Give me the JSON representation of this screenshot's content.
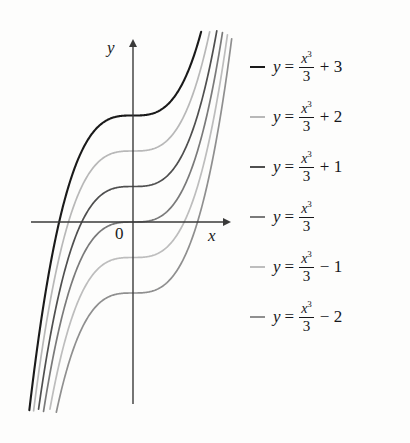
{
  "figure": {
    "axes": {
      "y_label": "y",
      "x_label": "x",
      "origin_label": "0"
    },
    "colors": {
      "background": "#fdfdfc",
      "axis": "#3a3a3a",
      "curve_dark": "#1a1a1a",
      "curve_mid_dark": "#4a4a4a",
      "curve_mid": "#6e6e6e",
      "curve_light": "#9a9a9a",
      "curve_lighter": "#b0b0b0"
    }
  },
  "legend": {
    "entries": [
      {
        "dash_color": "#1a1a1a",
        "lhs": "y",
        "eq": "=",
        "numerator": "x",
        "power": "3",
        "denominator": "3",
        "term": "+ 3",
        "c": 3
      },
      {
        "dash_color": "#b8b8b8",
        "lhs": "y",
        "eq": "=",
        "numerator": "x",
        "power": "3",
        "denominator": "3",
        "term": "+ 2",
        "c": 2
      },
      {
        "dash_color": "#4f4f4f",
        "lhs": "y",
        "eq": "=",
        "numerator": "x",
        "power": "3",
        "denominator": "3",
        "term": "+ 1",
        "c": 1
      },
      {
        "dash_color": "#7a7a7a",
        "lhs": "y",
        "eq": "=",
        "numerator": "x",
        "power": "3",
        "denominator": "3",
        "term": "",
        "c": 0
      },
      {
        "dash_color": "#bdbdbd",
        "lhs": "y",
        "eq": "=",
        "numerator": "x",
        "power": "3",
        "denominator": "3",
        "term": "− 1",
        "c": -1
      },
      {
        "dash_color": "#8f8f8f",
        "lhs": "y",
        "eq": "=",
        "numerator": "x",
        "power": "3",
        "denominator": "3",
        "term": "− 2",
        "c": -2
      }
    ]
  },
  "chart_data": {
    "type": "line",
    "title": "",
    "xlabel": "x",
    "ylabel": "y",
    "function_family": "y = x^3/3 + C",
    "xlim": [
      -3.0,
      2.6
    ],
    "ylim": [
      -5.2,
      4.6
    ],
    "grid": false,
    "legend_position": "right",
    "x": [
      -3.0,
      -2.75,
      -2.5,
      -2.25,
      -2.0,
      -1.75,
      -1.5,
      -1.25,
      -1.0,
      -0.75,
      -0.5,
      -0.25,
      0.0,
      0.25,
      0.5,
      0.75,
      1.0,
      1.25,
      1.5,
      1.75,
      2.0,
      2.25,
      2.5
    ],
    "series": [
      {
        "name": "y = x^3/3 + 3",
        "C": 3,
        "color": "#1a1a1a",
        "y_intercept": 3,
        "values": [
          -6.0,
          -3.93,
          -2.21,
          -0.797,
          0.333,
          1.214,
          1.875,
          2.349,
          2.667,
          2.859,
          2.958,
          2.995,
          3.0,
          3.005,
          3.042,
          3.141,
          3.333,
          3.651,
          4.125,
          4.786,
          5.667,
          6.797,
          8.208
        ]
      },
      {
        "name": "y = x^3/3 + 2",
        "C": 2,
        "color": "#b8b8b8",
        "y_intercept": 2,
        "values": [
          -7.0,
          -4.93,
          -3.21,
          -1.797,
          -0.667,
          0.214,
          0.875,
          1.349,
          1.667,
          1.859,
          1.958,
          1.995,
          2.0,
          2.005,
          2.042,
          2.141,
          2.333,
          2.651,
          3.125,
          3.786,
          4.667,
          5.797,
          7.208
        ]
      },
      {
        "name": "y = x^3/3 + 1",
        "C": 1,
        "color": "#4f4f4f",
        "y_intercept": 1,
        "values": [
          -8.0,
          -5.93,
          -4.21,
          -2.797,
          -1.667,
          -0.786,
          -0.125,
          0.349,
          0.667,
          0.859,
          0.958,
          0.995,
          1.0,
          1.005,
          1.042,
          1.141,
          1.333,
          1.651,
          2.125,
          2.786,
          3.667,
          4.797,
          6.208
        ]
      },
      {
        "name": "y = x^3/3",
        "C": 0,
        "color": "#7a7a7a",
        "y_intercept": 0,
        "values": [
          -9.0,
          -6.93,
          -5.21,
          -3.797,
          -2.667,
          -1.786,
          -1.125,
          -0.651,
          -0.333,
          -0.141,
          -0.042,
          -0.005,
          0.0,
          0.005,
          0.042,
          0.141,
          0.333,
          0.651,
          1.125,
          1.786,
          2.667,
          3.797,
          5.208
        ]
      },
      {
        "name": "y = x^3/3 - 1",
        "C": -1,
        "color": "#bdbdbd",
        "y_intercept": -1,
        "values": [
          -10.0,
          -7.93,
          -6.21,
          -4.797,
          -3.667,
          -2.786,
          -2.125,
          -1.651,
          -1.333,
          -1.141,
          -1.042,
          -1.005,
          -1.0,
          -0.995,
          -0.958,
          -0.859,
          -0.667,
          -0.349,
          0.125,
          0.786,
          1.667,
          2.797,
          4.208
        ]
      },
      {
        "name": "y = x^3/3 - 2",
        "C": -2,
        "color": "#8f8f8f",
        "y_intercept": -2,
        "values": [
          -11.0,
          -8.93,
          -7.21,
          -5.797,
          -4.667,
          -3.786,
          -3.125,
          -2.651,
          -2.333,
          -2.141,
          -2.042,
          -2.005,
          -2.0,
          -1.995,
          -1.958,
          -1.859,
          -1.667,
          -1.349,
          -0.875,
          -0.214,
          0.667,
          1.797,
          3.208
        ]
      }
    ]
  }
}
